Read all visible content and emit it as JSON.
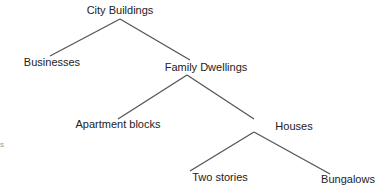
{
  "diagram": {
    "type": "tree",
    "line_color": "#555555",
    "nodes": [
      {
        "id": "city",
        "label": "City Buildings",
        "x": 120,
        "y": 5
      },
      {
        "id": "biz",
        "label": "Businesses",
        "x": 52,
        "y": 56
      },
      {
        "id": "family",
        "label": "Family Dwellings",
        "x": 206,
        "y": 60
      },
      {
        "id": "apt",
        "label": "Apartment blocks",
        "x": 118,
        "y": 117
      },
      {
        "id": "houses",
        "label": "Houses",
        "x": 290,
        "y": 119
      },
      {
        "id": "two",
        "label": "Two stories",
        "x": 220,
        "y": 171
      },
      {
        "id": "bung",
        "label": "Bungalows",
        "x": 332,
        "y": 173
      }
    ],
    "fragment": "s"
  }
}
